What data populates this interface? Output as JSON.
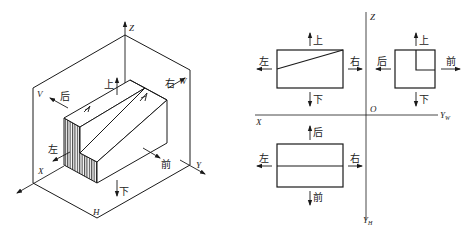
{
  "pictorial": {
    "axes": {
      "z": "Z",
      "x": "X",
      "y": "Y"
    },
    "planes": {
      "v": "V",
      "w": "W",
      "h": "H"
    },
    "directions": {
      "up": "上",
      "down": "下",
      "left": "左",
      "right": "右",
      "front": "前",
      "back": "后"
    }
  },
  "orthographic": {
    "axes": {
      "z": "Z",
      "x": "X",
      "origin": "O",
      "yw": "Y",
      "yw_sub": "W",
      "yh": "Y",
      "yh_sub": "H"
    },
    "front_view": {
      "up": "上",
      "down": "下",
      "left": "左",
      "right": "右"
    },
    "side_view": {
      "up": "上",
      "down": "下",
      "back": "后",
      "front": "前"
    },
    "top_view": {
      "back": "后",
      "front": "前",
      "left": "左",
      "right": "右"
    }
  },
  "colors": {
    "line": "#1a1a1a",
    "background": "#ffffff"
  }
}
